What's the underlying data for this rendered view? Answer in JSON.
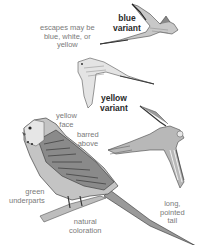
{
  "figure": {
    "colors": {
      "background": "#ffffff",
      "bold_label": "#2a2a2a",
      "light_label": "#7a7a7a",
      "bird_light": "#d8d8d8",
      "bird_mid": "#a8a8a8",
      "bird_dark": "#3a3a3a"
    },
    "labels": {
      "escapes": [
        "escapes may be",
        "blue, white, or",
        "yellow"
      ],
      "blue_variant": [
        "blue",
        "variant"
      ],
      "yellow_variant": [
        "yellow",
        "variant"
      ],
      "yellow_face": [
        "yellow",
        "face"
      ],
      "barred_above": [
        "barred",
        "above"
      ],
      "green_underparts": [
        "green",
        "underparts"
      ],
      "natural_coloration": [
        "natural",
        "coloration"
      ],
      "long_pointed_tail": [
        "long,",
        "pointed",
        "tail"
      ]
    },
    "birds": [
      {
        "name": "blue-variant-flying",
        "pose": "flying, upper right"
      },
      {
        "name": "yellow-variant-flying",
        "pose": "flying, middle"
      },
      {
        "name": "flying-from-below",
        "pose": "flying, lower right"
      },
      {
        "name": "natural-coloration-perched",
        "pose": "perched on branch, lower left"
      }
    ]
  }
}
